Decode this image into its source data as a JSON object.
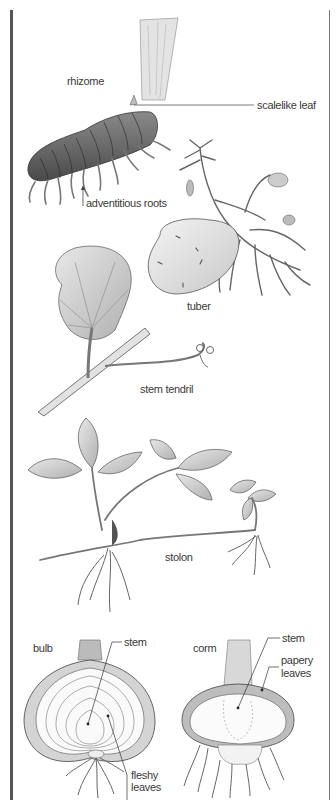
{
  "diagram": {
    "sections": [
      {
        "name": "rhizome",
        "label": "rhizome",
        "callouts": [
          "scalelike leaf",
          "adventitious roots"
        ]
      },
      {
        "name": "tuber",
        "label": "tuber",
        "callouts": []
      },
      {
        "name": "stem-tendril",
        "label": "stem tendril",
        "callouts": []
      },
      {
        "name": "stolon",
        "label": "stolon",
        "callouts": []
      },
      {
        "name": "bulb",
        "label": "bulb",
        "callouts": [
          "stem",
          "fleshy",
          "leaves"
        ]
      },
      {
        "name": "corm",
        "label": "corm",
        "callouts": [
          "stem",
          "papery",
          "leaves"
        ]
      }
    ]
  },
  "labels": {
    "rhizome": "rhizome",
    "scalelike_leaf": "scalelike leaf",
    "adventitious_roots": "adventitious roots",
    "tuber": "tuber",
    "stem_tendril": "stem tendril",
    "stolon": "stolon",
    "bulb": "bulb",
    "bulb_stem": "stem",
    "bulb_fleshy": "fleshy",
    "bulb_leaves": "leaves",
    "corm": "corm",
    "corm_stem": "stem",
    "corm_papery": "papery",
    "corm_leaves": "leaves"
  },
  "colors": {
    "ink": "#3a3a3a",
    "shade": "#bdbdbd",
    "light_shade": "#e6e6e6",
    "frame": "#555555"
  }
}
